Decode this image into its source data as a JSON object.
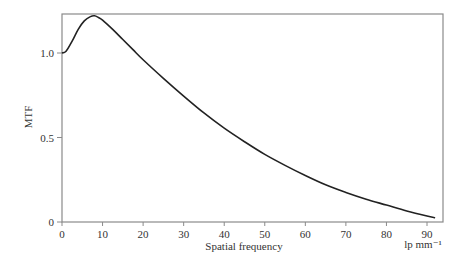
{
  "chart_data": {
    "type": "line",
    "title": "",
    "xlabel": "Spatial frequency",
    "xunit": "lp mm⁻¹",
    "ylabel": "MTF",
    "xlim": [
      0,
      95
    ],
    "ylim": [
      0,
      1.27
    ],
    "xticks": [
      0,
      10,
      20,
      30,
      40,
      50,
      60,
      70,
      80,
      90
    ],
    "xtick_labels": [
      "0",
      "10",
      "20",
      "30",
      "40",
      "50",
      "60",
      "70",
      "80",
      "90"
    ],
    "yticks": [
      0,
      0.5,
      1.0
    ],
    "ytick_labels": [
      "0",
      "0.5",
      "1.0"
    ],
    "grid": false,
    "legend": null,
    "series": [
      {
        "name": "MTF",
        "color": "#222222",
        "x": [
          0,
          1,
          2.5,
          4,
          5.5,
          7,
          8,
          9,
          10,
          12.5,
          15,
          17.5,
          20,
          25,
          30,
          35,
          40,
          45,
          50,
          55,
          60,
          65,
          70,
          75,
          80,
          85,
          90,
          92
        ],
        "y": [
          1.0,
          1.01,
          1.07,
          1.14,
          1.19,
          1.215,
          1.22,
          1.21,
          1.195,
          1.14,
          1.08,
          1.02,
          0.96,
          0.85,
          0.745,
          0.645,
          0.555,
          0.475,
          0.4,
          0.335,
          0.275,
          0.22,
          0.175,
          0.135,
          0.1,
          0.065,
          0.035,
          0.025
        ]
      }
    ]
  }
}
